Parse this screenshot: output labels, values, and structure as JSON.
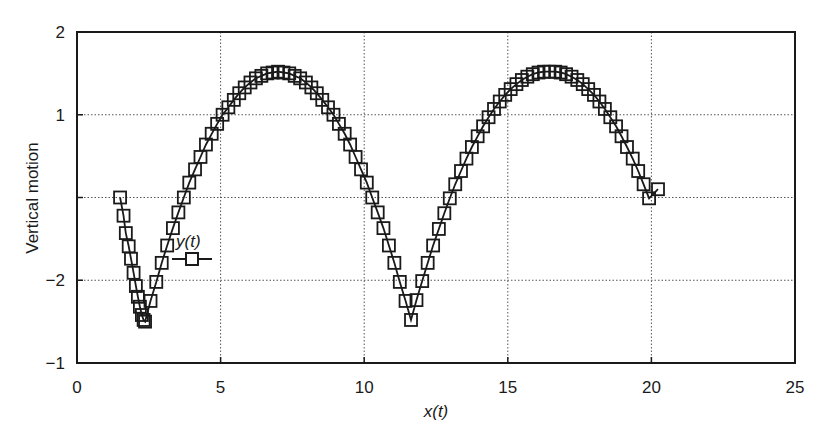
{
  "chart_data": {
    "type": "line",
    "title": "",
    "xlabel": "x(t)",
    "ylabel": "Vertical motion",
    "xlim": [
      0,
      25
    ],
    "x_ticks": [
      0,
      5,
      10,
      15,
      20,
      25
    ],
    "x_tick_labels": [
      "0",
      "5",
      "10",
      "15",
      "20",
      "25"
    ],
    "y_tick_labels_bottom_to_top": [
      "−1",
      "−2",
      "",
      "1",
      "2"
    ],
    "y_scale_note": "y positions are index-based (0=bottom tick, 4=top tick); tick labels as printed",
    "ylim_index": [
      0,
      4
    ],
    "grid": true,
    "grid_style": "dotted",
    "legend": {
      "entries": [
        "y(t)"
      ],
      "position": "inside-left",
      "marker": "square",
      "line": "solid"
    },
    "series": [
      {
        "name": "y(t)",
        "marker": "open-square",
        "color": "#1a1a1a",
        "points": [
          [
            1.5,
            2.0
          ],
          [
            1.62,
            1.78
          ],
          [
            1.7,
            1.57
          ],
          [
            1.8,
            1.41
          ],
          [
            1.88,
            1.26
          ],
          [
            1.97,
            1.09
          ],
          [
            2.05,
            0.93
          ],
          [
            2.12,
            0.8
          ],
          [
            2.19,
            0.68
          ],
          [
            2.26,
            0.58
          ],
          [
            2.32,
            0.52
          ],
          [
            2.37,
            0.5
          ],
          [
            2.56,
            0.75
          ],
          [
            2.76,
            0.98
          ],
          [
            2.95,
            1.21
          ],
          [
            3.14,
            1.42
          ],
          [
            3.34,
            1.63
          ],
          [
            3.53,
            1.82
          ],
          [
            3.72,
            2.0
          ],
          [
            3.91,
            2.18
          ],
          [
            4.11,
            2.34
          ],
          [
            4.3,
            2.49
          ],
          [
            4.49,
            2.64
          ],
          [
            4.69,
            2.77
          ],
          [
            4.88,
            2.89
          ],
          [
            5.07,
            3.0
          ],
          [
            5.27,
            3.09
          ],
          [
            5.46,
            3.18
          ],
          [
            5.65,
            3.26
          ],
          [
            5.84,
            3.33
          ],
          [
            6.04,
            3.39
          ],
          [
            6.23,
            3.44
          ],
          [
            6.42,
            3.47
          ],
          [
            6.62,
            3.5
          ],
          [
            6.81,
            3.51
          ],
          [
            7.0,
            3.52
          ],
          [
            7.19,
            3.51
          ],
          [
            7.39,
            3.5
          ],
          [
            7.58,
            3.47
          ],
          [
            7.77,
            3.44
          ],
          [
            7.97,
            3.39
          ],
          [
            8.16,
            3.33
          ],
          [
            8.35,
            3.26
          ],
          [
            8.54,
            3.18
          ],
          [
            8.74,
            3.09
          ],
          [
            8.93,
            3.0
          ],
          [
            9.12,
            2.89
          ],
          [
            9.32,
            2.77
          ],
          [
            9.51,
            2.64
          ],
          [
            9.7,
            2.49
          ],
          [
            9.89,
            2.34
          ],
          [
            10.09,
            2.18
          ],
          [
            10.28,
            2.0
          ],
          [
            10.47,
            1.82
          ],
          [
            10.67,
            1.63
          ],
          [
            10.86,
            1.42
          ],
          [
            11.05,
            1.21
          ],
          [
            11.24,
            0.98
          ],
          [
            11.44,
            0.75
          ],
          [
            11.63,
            0.52
          ],
          [
            11.82,
            0.76
          ],
          [
            12.02,
            0.99
          ],
          [
            12.21,
            1.21
          ],
          [
            12.4,
            1.42
          ],
          [
            12.6,
            1.62
          ],
          [
            12.79,
            1.81
          ],
          [
            12.98,
            1.99
          ],
          [
            13.17,
            2.16
          ],
          [
            13.37,
            2.32
          ],
          [
            13.56,
            2.47
          ],
          [
            13.75,
            2.61
          ],
          [
            13.95,
            2.74
          ],
          [
            14.14,
            2.86
          ],
          [
            14.33,
            2.97
          ],
          [
            14.52,
            3.07
          ],
          [
            14.72,
            3.16
          ],
          [
            14.91,
            3.24
          ],
          [
            15.1,
            3.31
          ],
          [
            15.3,
            3.37
          ],
          [
            15.49,
            3.42
          ],
          [
            15.68,
            3.46
          ],
          [
            15.87,
            3.49
          ],
          [
            16.07,
            3.51
          ],
          [
            16.26,
            3.52
          ],
          [
            16.45,
            3.52
          ],
          [
            16.65,
            3.52
          ],
          [
            16.84,
            3.51
          ],
          [
            17.03,
            3.49
          ],
          [
            17.22,
            3.46
          ],
          [
            17.42,
            3.42
          ],
          [
            17.61,
            3.37
          ],
          [
            17.8,
            3.31
          ],
          [
            18.0,
            3.24
          ],
          [
            18.19,
            3.16
          ],
          [
            18.38,
            3.07
          ],
          [
            18.57,
            2.97
          ],
          [
            18.77,
            2.86
          ],
          [
            18.96,
            2.74
          ],
          [
            19.15,
            2.61
          ],
          [
            19.35,
            2.47
          ],
          [
            19.54,
            2.32
          ],
          [
            19.73,
            2.16
          ],
          [
            19.92,
            1.99
          ],
          [
            20.23,
            2.1
          ]
        ]
      }
    ]
  },
  "axes": {
    "xlabel": "x(t)",
    "ylabel": "Vertical motion",
    "x_tick_labels": [
      "0",
      "5",
      "10",
      "15",
      "20",
      "25"
    ],
    "y_tick_labels": [
      "−1",
      "−2",
      "",
      "1",
      "2"
    ]
  },
  "legend": {
    "label": "y(t)"
  }
}
